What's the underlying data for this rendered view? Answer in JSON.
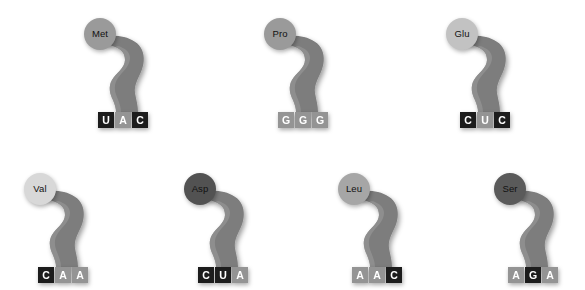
{
  "diagram": {
    "background_color": "#ffffff",
    "ribbon_color": "#7d7d7d",
    "tile_dark_color": "#1c1c1c",
    "tile_light_color": "#949494",
    "tile_text_color": "#ffffff"
  },
  "trnas": [
    {
      "id": "trna-met",
      "amino_acid": "Met",
      "amino_circle_color": "#9a9a9a",
      "anticodon": "UAC",
      "bases": [
        {
          "letter": "U",
          "shade": "dark"
        },
        {
          "letter": "A",
          "shade": "light"
        },
        {
          "letter": "C",
          "shade": "dark"
        }
      ],
      "x": 68,
      "y": 8,
      "row": 0,
      "column": 0
    },
    {
      "id": "trna-pro",
      "amino_acid": "Pro",
      "amino_circle_color": "#9a9a9a",
      "anticodon": "GGG",
      "bases": [
        {
          "letter": "G",
          "shade": "light"
        },
        {
          "letter": "G",
          "shade": "light"
        },
        {
          "letter": "G",
          "shade": "light"
        }
      ],
      "x": 248,
      "y": 8,
      "row": 0,
      "column": 1
    },
    {
      "id": "trna-glu",
      "amino_acid": "Glu",
      "amino_circle_color": "#c2c2c2",
      "anticodon": "CUC",
      "bases": [
        {
          "letter": "C",
          "shade": "dark"
        },
        {
          "letter": "U",
          "shade": "light"
        },
        {
          "letter": "C",
          "shade": "dark"
        }
      ],
      "x": 430,
      "y": 8,
      "row": 0,
      "column": 2
    },
    {
      "id": "trna-val",
      "amino_acid": "Val",
      "amino_circle_color": "#d8d8d8",
      "anticodon": "CAA",
      "bases": [
        {
          "letter": "C",
          "shade": "dark"
        },
        {
          "letter": "A",
          "shade": "light"
        },
        {
          "letter": "A",
          "shade": "light"
        }
      ],
      "x": 8,
      "y": 163,
      "row": 1,
      "column": 0
    },
    {
      "id": "trna-asp",
      "amino_acid": "Asp",
      "amino_circle_color": "#525252",
      "anticodon": "CUA",
      "bases": [
        {
          "letter": "C",
          "shade": "dark"
        },
        {
          "letter": "U",
          "shade": "dark"
        },
        {
          "letter": "A",
          "shade": "light"
        }
      ],
      "x": 168,
      "y": 163,
      "row": 1,
      "column": 1
    },
    {
      "id": "trna-leu",
      "amino_acid": "Leu",
      "amino_circle_color": "#a6a6a6",
      "anticodon": "AAC",
      "bases": [
        {
          "letter": "A",
          "shade": "light"
        },
        {
          "letter": "A",
          "shade": "light"
        },
        {
          "letter": "C",
          "shade": "dark"
        }
      ],
      "x": 322,
      "y": 163,
      "row": 1,
      "column": 2
    },
    {
      "id": "trna-ser",
      "amino_acid": "Ser",
      "amino_circle_color": "#5a5a5a",
      "anticodon": "AGA",
      "bases": [
        {
          "letter": "A",
          "shade": "light"
        },
        {
          "letter": "G",
          "shade": "dark"
        },
        {
          "letter": "A",
          "shade": "light"
        }
      ],
      "x": 478,
      "y": 163,
      "row": 1,
      "column": 3
    }
  ]
}
